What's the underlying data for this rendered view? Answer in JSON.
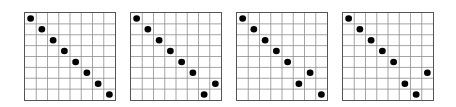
{
  "figure": {
    "grid_size": 8,
    "line_color": "#8a8a8a",
    "border_color": "#555555",
    "dot_color": "#000000",
    "boards": [
      {
        "label": "board-1",
        "left": 24,
        "queens_col_by_row": [
          0,
          1,
          2,
          3,
          4,
          5,
          6,
          7
        ]
      },
      {
        "label": "board-2",
        "left": 130,
        "queens_col_by_row": [
          0,
          1,
          2,
          3,
          4,
          5,
          7,
          6
        ]
      },
      {
        "label": "board-3",
        "left": 236,
        "queens_col_by_row": [
          0,
          1,
          2,
          3,
          4,
          6,
          5,
          7
        ]
      },
      {
        "label": "board-4",
        "left": 342,
        "queens_col_by_row": [
          0,
          1,
          2,
          3,
          4,
          7,
          5,
          6
        ]
      }
    ]
  }
}
